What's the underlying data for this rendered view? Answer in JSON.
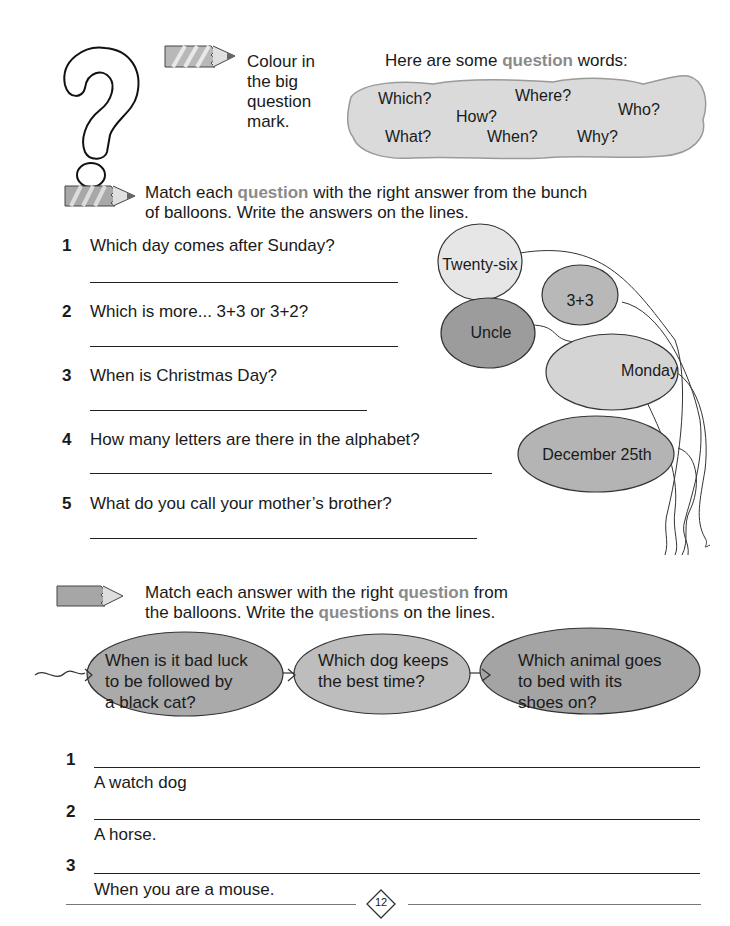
{
  "worksheet": {
    "colour_instruction": [
      "Colour in",
      "the big",
      "question",
      "mark."
    ],
    "question_words_intro": {
      "before": "Here are some ",
      "highlight": "question",
      "after": " words:"
    },
    "question_words": [
      "Which?",
      "Where?",
      "Who?",
      "How?",
      "What?",
      "When?",
      "Why?"
    ],
    "section1": {
      "instruction_line1": {
        "before": "Match each ",
        "highlight": "question",
        "after": " with the right answer from the bunch"
      },
      "instruction_line2": "of balloons. Write the answers on the lines.",
      "questions": [
        {
          "num": "1",
          "text": "Which day comes after Sunday?"
        },
        {
          "num": "2",
          "text": "Which is more... 3+3 or 3+2?"
        },
        {
          "num": "3",
          "text": "When is Christmas Day?"
        },
        {
          "num": "4",
          "text": "How many letters are there in the alphabet?"
        },
        {
          "num": "5",
          "text": "What do you call your mother’s brother?"
        }
      ],
      "balloons": [
        "Twenty-six",
        "3+3",
        "Uncle",
        "Monday",
        "December 25th"
      ]
    },
    "section2": {
      "instruction_line1": {
        "before": "Match each answer with the right ",
        "highlight": "question",
        "after": " from"
      },
      "instruction_line2": {
        "before": "the balloons. Write the ",
        "highlight": "questions",
        "after": " on the lines."
      },
      "balloons": [
        [
          "When is it bad luck",
          "to be followed by",
          "a black cat?"
        ],
        [
          "Which dog keeps",
          "the best time?"
        ],
        [
          "Which animal goes",
          "to bed with its",
          "shoes on?"
        ]
      ],
      "answers": [
        {
          "num": "1",
          "text": "A watch dog"
        },
        {
          "num": "2",
          "text": "A horse."
        },
        {
          "num": "3",
          "text": "When you are a mouse."
        }
      ]
    },
    "page_number": "12",
    "colors": {
      "highlight": "#8a8a8a",
      "balloon_light": "#e4e4e4",
      "balloon_mid": "#bcbcbc",
      "balloon_dark": "#a0a0a0"
    }
  }
}
